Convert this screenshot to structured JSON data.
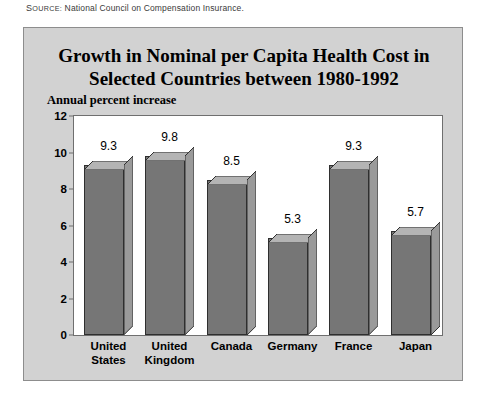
{
  "source": {
    "label_cap": "S",
    "label_rest": "OURCE:",
    "text": "National Council on Compensation Insurance."
  },
  "chart_data": {
    "type": "bar",
    "title": "Growth in Nominal per Capita Health Cost in Selected Countries between 1980-1992",
    "title_line1": "Growth in Nominal per Capita Health Cost in",
    "title_line2": "Selected Countries between 1980-1992",
    "subtitle": "Annual percent increase",
    "xlabel": "",
    "ylabel": "Annual percent increase",
    "ylim": [
      0,
      12
    ],
    "yticks": [
      0,
      2,
      4,
      6,
      8,
      10,
      12
    ],
    "ytick_labels": [
      "0",
      "2",
      "4",
      "6",
      "8",
      "10",
      "12"
    ],
    "grid": false,
    "legend": "none",
    "categories": [
      "United States",
      "United Kingdom",
      "Canada",
      "Germany",
      "France",
      "Japan"
    ],
    "category_lines": [
      [
        "United",
        "States"
      ],
      [
        "United",
        "Kingdom"
      ],
      [
        "Canada"
      ],
      [
        "Germany"
      ],
      [
        "France"
      ],
      [
        "Japan"
      ]
    ],
    "values": [
      9.3,
      9.8,
      8.5,
      5.3,
      9.3,
      5.7
    ],
    "value_labels": [
      "9.3",
      "9.8",
      "8.5",
      "5.3",
      "9.3",
      "5.7"
    ],
    "colors": {
      "bar_front": "#767676",
      "bar_top": "#b4b4b4",
      "bar_side": "#9a9a9a",
      "bar_outline": "#2f2f2f",
      "plot_background": "#ffffff",
      "panel_background": "#d2d2d2",
      "panel_border": "#8d8d8d",
      "axis": "#6f6f6f",
      "text": "#000000"
    }
  }
}
